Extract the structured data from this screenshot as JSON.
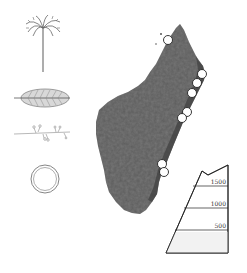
{
  "figure": {
    "type": "illustrated-map",
    "colors": {
      "island": "#5a5a5a",
      "marker_fill": "#ffffff",
      "marker_stroke": "#222222",
      "line": "#333333"
    }
  },
  "legend_icons": [
    {
      "name": "palm-tree-icon"
    },
    {
      "name": "leaf-icon"
    },
    {
      "name": "flowering-sprig-icon"
    },
    {
      "name": "ring-icon"
    }
  ],
  "markers": [
    {
      "x": 168,
      "y": 40
    },
    {
      "x": 202,
      "y": 74
    },
    {
      "x": 197,
      "y": 83
    },
    {
      "x": 192,
      "y": 93
    },
    {
      "x": 187,
      "y": 112
    },
    {
      "x": 182,
      "y": 118
    },
    {
      "x": 162,
      "y": 164
    },
    {
      "x": 164,
      "y": 172
    }
  ],
  "elevation_profile": {
    "unit": "m",
    "ticks": [
      {
        "label": "1500",
        "y": 186
      },
      {
        "label": "1000",
        "y": 208
      },
      {
        "label": "500",
        "y": 230
      }
    ]
  }
}
